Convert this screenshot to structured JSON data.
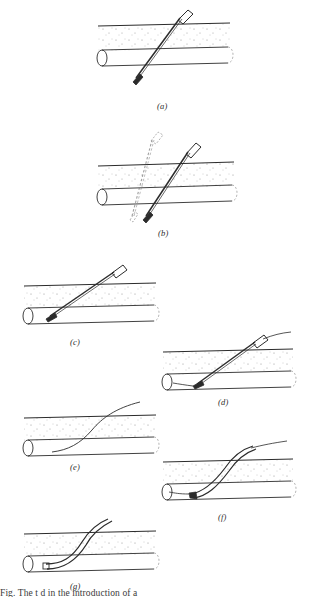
{
  "figure": {
    "ink_color": "#2b2b2b",
    "stipple_color": "#8a8a8a",
    "background": "#ffffff",
    "panel_count": 7
  },
  "panels": [
    {
      "id": "a",
      "label": "(a)",
      "description": "Needle passed at a steep angle through skin and tissue, puncturing completely through both walls of the vessel",
      "align": "center",
      "instrument": "needle",
      "instrument_state": "through-and-through puncture",
      "has_ghost": false,
      "has_guidewire": false,
      "has_catheter": false
    },
    {
      "id": "b",
      "label": "(b)",
      "description": "Needle withdrawn and redirected; dashed outline marks the previous needle position",
      "align": "center",
      "instrument": "needle",
      "instrument_state": "withdrawn and redirected",
      "has_ghost": true,
      "has_guidewire": false,
      "has_catheter": false
    },
    {
      "id": "c",
      "label": "(c)",
      "description": "Needle tip withdrawn back into the lumen of the vessel at a shallower angle",
      "align": "left",
      "instrument": "needle",
      "instrument_state": "tip within lumen",
      "has_ghost": false,
      "has_guidewire": false,
      "has_catheter": false
    },
    {
      "id": "d",
      "label": "(d)",
      "description": "Flexible guidewire threaded through the needle and advanced along the vessel lumen",
      "align": "right",
      "instrument": "needle-with-guidewire",
      "instrument_state": "guidewire advanced through needle",
      "has_ghost": false,
      "has_guidewire": true,
      "has_catheter": false
    },
    {
      "id": "e",
      "label": "(e)",
      "description": "Needle removed, leaving only the guidewire in place within the vessel",
      "align": "left",
      "instrument": "guidewire",
      "instrument_state": "needle removed, wire remains",
      "has_ghost": false,
      "has_guidewire": true,
      "has_catheter": false
    },
    {
      "id": "f",
      "label": "(f)",
      "description": "Catheter advanced over the guidewire into the vessel lumen",
      "align": "right",
      "instrument": "catheter-over-guidewire",
      "instrument_state": "catheter railroaded over wire",
      "has_ghost": false,
      "has_guidewire": true,
      "has_catheter": true
    },
    {
      "id": "g",
      "label": "(g)",
      "description": "Guidewire withdrawn, leaving the catheter seated within the vessel",
      "align": "left",
      "instrument": "catheter",
      "instrument_state": "catheter in place, wire removed",
      "has_ghost": false,
      "has_guidewire": false,
      "has_catheter": true
    }
  ],
  "caption": {
    "text": "Fig.  The  t  d in the introduction of a",
    "note": "bottom caption line is clipped by the page edge and only partially legible"
  },
  "anatomy": {
    "tissue_label": "subcutaneous tissue",
    "vessel_label": "vessel",
    "skin_label": "skin surface"
  }
}
